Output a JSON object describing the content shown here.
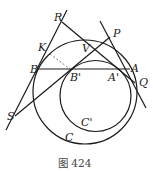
{
  "figure": {
    "caption": "图 424",
    "circles": [
      {
        "name": "C",
        "cx": 85,
        "cy": 92,
        "r": 52,
        "label": "C"
      },
      {
        "name": "C'",
        "cx": 95.5,
        "cy": 96,
        "r": 35.5,
        "label": "C'"
      }
    ],
    "points": {
      "R": {
        "label": "R",
        "x": 60,
        "y": 21
      },
      "K": {
        "label": "K",
        "x": 48,
        "y": 50
      },
      "B": {
        "label": "B",
        "x": 37,
        "y": 69
      },
      "S": {
        "label": "S",
        "x": 15,
        "y": 116
      },
      "V": {
        "label": "V",
        "x": 90,
        "y": 44
      },
      "P": {
        "label": "P",
        "x": 111,
        "y": 34
      },
      "B_prime": {
        "label": "B'",
        "x": 70,
        "y": 69
      },
      "A_prime": {
        "label": "A'",
        "x": 121,
        "y": 69
      },
      "A": {
        "label": "A",
        "x": 130,
        "y": 69
      },
      "Q": {
        "label": "Q",
        "x": 134,
        "y": 80
      }
    },
    "labels": {
      "R": "R",
      "K": "K",
      "B": "B",
      "S": "S",
      "V": "V",
      "P": "P",
      "B_prime": "B'",
      "A_prime": "A'",
      "A": "A",
      "Q": "Q",
      "C": "C",
      "C_prime": "C'"
    },
    "colors": {
      "stroke": "#1a1a1a",
      "background": "#ffffff"
    }
  }
}
